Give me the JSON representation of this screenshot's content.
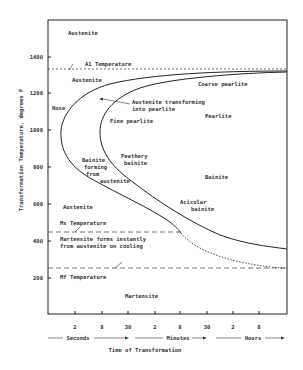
{
  "diagram": {
    "type": "TTT isothermal transformation diagram",
    "y_axis": {
      "label": "Transformation Temperature, degrees F",
      "ticks": [
        {
          "label": "1400",
          "y": 57
        },
        {
          "label": "1200",
          "y": 93
        },
        {
          "label": "1000",
          "y": 130
        },
        {
          "label": "800",
          "y": 167
        },
        {
          "label": "600",
          "y": 204
        },
        {
          "label": "400",
          "y": 241
        },
        {
          "label": "200",
          "y": 278
        }
      ]
    },
    "x_axis": {
      "label": "Time of Transformation",
      "ticks": [
        {
          "label": "2",
          "x": 75
        },
        {
          "label": "8",
          "x": 102
        },
        {
          "label": "30",
          "x": 128
        },
        {
          "label": "2",
          "x": 155
        },
        {
          "label": "8",
          "x": 180
        },
        {
          "label": "30",
          "x": 207
        },
        {
          "label": "2",
          "x": 233
        },
        {
          "label": "8",
          "x": 259
        }
      ],
      "units": [
        {
          "label": "Seconds",
          "x": 75
        },
        {
          "label": "Minutes",
          "x": 178
        },
        {
          "label": "Hours",
          "x": 253
        }
      ]
    },
    "lines": {
      "a1": "A1 Temperature",
      "ms": "Ms Temperature",
      "mf": "Mf Temperature"
    },
    "regions": {
      "austenite_top": "Austenite",
      "austenite_upper": "Austenite",
      "nose": "Nose",
      "austenite_transforming_1": "Austenite transforming",
      "austenite_transforming_2": "into pearlite",
      "coarse_pearlite": "Coarse pearlite",
      "pearlite": "Pearlite",
      "fine_pearlite": "Fine pearlite",
      "bainite_forming_1": "Bainite",
      "bainite_forming_2": "forming",
      "bainite_forming_3": "from",
      "bainite_forming_4": "austenite",
      "feathery_1": "Feathery",
      "feathery_2": "bainite",
      "bainite": "Bainite",
      "acicular_1": "Acicular",
      "acicular_2": "bainite",
      "austenite_lower": "Austenite",
      "martensite_forms_1": "Martensite forms instantly",
      "martensite_forms_2": "from austenite on cooling",
      "martensite": "Martensite"
    }
  }
}
